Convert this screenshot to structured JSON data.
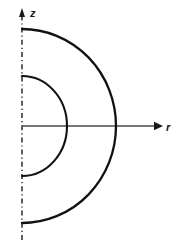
{
  "figure": {
    "title": "",
    "type": "geometry-diagram",
    "background_color": "#ffffff",
    "stroke_color": "#111111",
    "axis_color": "#4a4a4a",
    "axes": {
      "vertical": {
        "label": "z",
        "style": "dash-dot",
        "direction": "up",
        "arrowhead": true,
        "x": 22,
        "y_top": 10,
        "y_bottom": 240
      },
      "horizontal": {
        "label": "r",
        "style": "solid",
        "direction": "right",
        "arrowhead": true,
        "y": 126,
        "x_start": 22,
        "x_end": 162
      }
    },
    "origin": {
      "x": 22,
      "y": 126
    },
    "arcs": [
      {
        "name": "inner-arc",
        "shape": "semicircle",
        "orientation": "right-half",
        "radius_x": 45,
        "radius_y": 50,
        "top_point": {
          "x": 22,
          "y": 76
        },
        "right_point": {
          "x": 67,
          "y": 126
        },
        "bottom_point": {
          "x": 22,
          "y": 176
        },
        "stroke_width": 2.1
      },
      {
        "name": "outer-arc",
        "shape": "semicircle",
        "orientation": "right-half",
        "radius_x": 94,
        "radius_y": 97,
        "top_point": {
          "x": 22,
          "y": 29
        },
        "right_point": {
          "x": 116,
          "y": 126
        },
        "bottom_point": {
          "x": 22,
          "y": 223
        },
        "stroke_width": 2.3
      }
    ],
    "labels": {
      "z_label": "z",
      "z_label_pos": {
        "x": 30,
        "y": 17
      },
      "r_label": "r",
      "r_label_pos": {
        "x": 166,
        "y": 131
      }
    }
  }
}
